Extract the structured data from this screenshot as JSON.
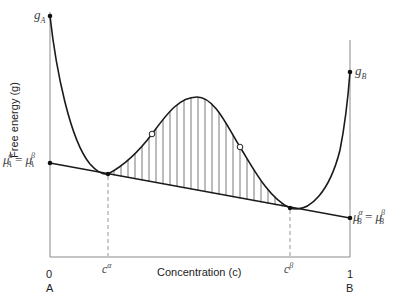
{
  "diagram": {
    "y_axis_label": "Free energy (g)",
    "x_axis_label": "Concentration (c)",
    "x_ticks": [
      {
        "value": "0",
        "component": "A"
      },
      {
        "value": "1",
        "component": "B"
      }
    ],
    "points": {
      "g_A": {
        "symbol": "g",
        "sub": "A"
      },
      "g_B": {
        "symbol": "g",
        "sub": "B"
      },
      "c_alpha": {
        "symbol": "c",
        "sup": "α"
      },
      "c_beta": {
        "symbol": "c",
        "sup": "β"
      }
    },
    "mu_left": {
      "lhs_sup": "α",
      "lhs_sub": "A",
      "rhs_sup": "β",
      "rhs_sub": "A",
      "symbol": "μ",
      "eq": "="
    },
    "mu_right": {
      "lhs_sup": "α",
      "lhs_sub": "B",
      "rhs_sup": "β",
      "rhs_sub": "B",
      "symbol": "μ",
      "eq": "="
    },
    "colors": {
      "curve": "#1a1a1a",
      "axis": "#888888",
      "hatch": "#555555",
      "dashed": "#999999"
    }
  }
}
